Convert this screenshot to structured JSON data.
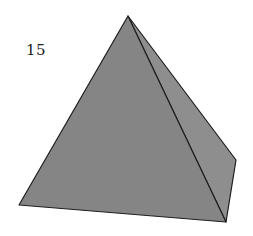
{
  "figure": {
    "label": "15",
    "shape": "square pyramid",
    "colors": {
      "front_face": "#858585",
      "right_face": "#8e8e8e",
      "edge": "#1e1e1e",
      "background": "#ffffff"
    },
    "vertices": {
      "apex": [
        128,
        16
      ],
      "base_left": [
        19,
        205
      ],
      "base_front_right": [
        226,
        222
      ],
      "base_back_right": [
        236,
        160
      ]
    }
  }
}
